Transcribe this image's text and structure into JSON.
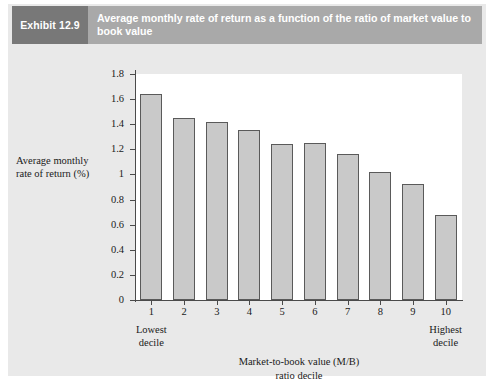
{
  "header": {
    "exhibit_tab": "Exhibit 12.9",
    "title": "Average monthly rate of return as a function of the ratio of market value to book value",
    "tab_color": "#787878",
    "band_color": "#a9a9a9",
    "text_color": "#ffffff"
  },
  "figure": {
    "background": "#e9e9e9",
    "plot_background": "#ffffff",
    "bar_fill": "#c9c9c9",
    "bar_border": "#5a5a5a",
    "axis_color": "#4a4a4a"
  },
  "annotations": {
    "lowest_decile": "Lowest\ndecile",
    "lowest_decile_line1": "Lowest",
    "lowest_decile_line2": "decile",
    "highest_decile_line1": "Highest",
    "highest_decile_line2": "decile"
  },
  "chart_data": {
    "type": "bar",
    "title": "Average monthly rate of return as a function of the ratio of market value to book value",
    "subtitle": "",
    "xlabel": "Market-to-book value (M/B) ratio decile",
    "xlabel_line1": "Market-to-book value (M/B)",
    "xlabel_line2": "ratio decile",
    "ylabel": "Average monthly rate of return (%)",
    "ylabel_line1": "Average monthly",
    "ylabel_line2": "rate of return (%)",
    "categories": [
      "1",
      "2",
      "3",
      "4",
      "5",
      "6",
      "7",
      "8",
      "9",
      "10"
    ],
    "values": [
      1.64,
      1.45,
      1.42,
      1.355,
      1.24,
      1.25,
      1.165,
      1.02,
      0.925,
      0.675
    ],
    "ylim": [
      0,
      1.8
    ],
    "ytick_step": 0.2,
    "yticks": [
      "0",
      "0.2",
      "0.4",
      "0.6",
      "0.8",
      "1",
      "1.2",
      "1.4",
      "1.6",
      "1.8"
    ],
    "ytick_values": [
      0,
      0.2,
      0.4,
      0.6,
      0.8,
      1,
      1.2,
      1.4,
      1.6,
      1.8
    ],
    "grid": false,
    "legend": false
  }
}
